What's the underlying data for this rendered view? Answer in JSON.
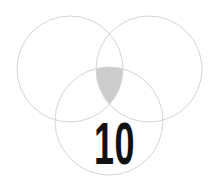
{
  "diagram": {
    "type": "venn-3",
    "circles": [
      {
        "name": "left",
        "cx": 70,
        "cy": 69,
        "r": 53
      },
      {
        "name": "right",
        "cx": 149,
        "cy": 69,
        "r": 53
      },
      {
        "name": "bottom",
        "cx": 109,
        "cy": 121,
        "r": 54
      }
    ],
    "highlighted_region": "intersection of all three circles",
    "label": "10"
  },
  "colors": {
    "stroke": "#d4d4d4",
    "highlight_fill": "#cccccc",
    "text": "#111111",
    "background": "#ffffff"
  }
}
